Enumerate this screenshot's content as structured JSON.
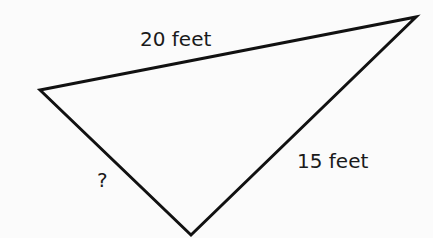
{
  "diagram": {
    "type": "triangle",
    "vertices": {
      "left": [
        40,
        90
      ],
      "top_right": [
        416,
        17
      ],
      "bottom": [
        191,
        235
      ]
    },
    "sides": {
      "top": {
        "label": "20 feet"
      },
      "right": {
        "label": "15 feet"
      },
      "left": {
        "label": "?"
      }
    },
    "stroke_color": "#111111"
  }
}
